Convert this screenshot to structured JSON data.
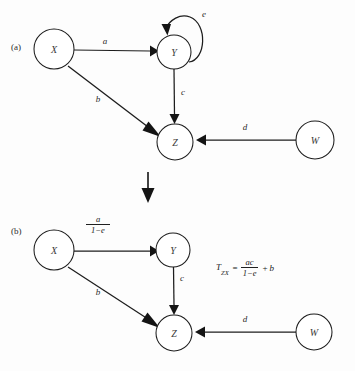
{
  "figure": {
    "width": 355,
    "height": 371,
    "background": "#fdfdfd",
    "stroke_color": "#1d1d1d",
    "text_color": "#202020"
  },
  "panel_a": {
    "label": "(a)",
    "nodes": [
      {
        "id": "X",
        "label": "X",
        "cx": 54,
        "cy": 49,
        "r": 20
      },
      {
        "id": "Y",
        "label": "Y",
        "cx": 174,
        "cy": 52,
        "r": 17
      },
      {
        "id": "Z",
        "label": "Z",
        "cx": 175,
        "cy": 142,
        "r": 18
      },
      {
        "id": "W",
        "label": "W",
        "cx": 315,
        "cy": 140,
        "r": 19
      }
    ],
    "edges": [
      {
        "from": "X",
        "to": "Y",
        "label": "a",
        "label_x": 105,
        "label_y": 44
      },
      {
        "from": "X",
        "to": "Z",
        "label": "b",
        "label_x": 98,
        "label_y": 102
      },
      {
        "from": "Y",
        "to": "Z",
        "label": "c",
        "label_x": 181,
        "label_y": 95
      },
      {
        "from": "W",
        "to": "Z",
        "label": "d",
        "label_x": 245,
        "label_y": 130
      },
      {
        "from": "Y",
        "to": "Y",
        "label": "e",
        "label_x": 203,
        "label_y": 15,
        "type": "self-loop"
      }
    ]
  },
  "transition": {
    "name": "downward-arrow",
    "x": 148,
    "y_start": 172,
    "y_end": 202
  },
  "panel_b": {
    "label": "(b)",
    "nodes": [
      {
        "id": "X",
        "label": "X",
        "cx": 54,
        "cy": 250,
        "r": 20
      },
      {
        "id": "Y",
        "label": "Y",
        "cx": 173,
        "cy": 250,
        "r": 17
      },
      {
        "id": "Z",
        "label": "Z",
        "cx": 174,
        "cy": 333,
        "r": 18
      },
      {
        "id": "W",
        "label": "W",
        "cx": 314,
        "cy": 332,
        "r": 18
      }
    ],
    "edges": [
      {
        "from": "X",
        "to": "Y",
        "label_type": "fraction",
        "numerator": "a",
        "denominator": "1−e",
        "label_x": 97,
        "label_y": 221
      },
      {
        "from": "X",
        "to": "Z",
        "label": "b",
        "label_x": 98,
        "label_y": 295
      },
      {
        "from": "Y",
        "to": "Z",
        "label": "c",
        "label_x": 180,
        "label_y": 281
      },
      {
        "from": "W",
        "to": "Z",
        "label": "d",
        "label_x": 245,
        "label_y": 322
      }
    ],
    "formula": {
      "lhs": "T",
      "lhs_subscript": "ZX",
      "equals": "=",
      "numerator": "ac",
      "denominator": "1−e",
      "plus": "+",
      "addend": "b",
      "x": 216,
      "y": 260
    }
  }
}
